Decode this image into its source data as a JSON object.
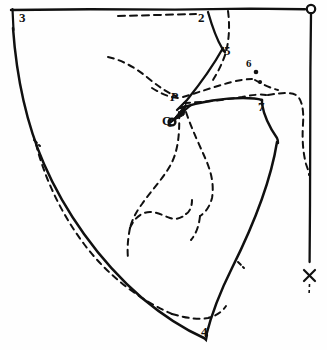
{
  "figure": {
    "background_color": "#fefefe",
    "ink_color": "#101010",
    "canvas": {
      "width": 327,
      "height": 350
    }
  },
  "labels": {
    "corner_top_left": "3",
    "top_center_right": "2",
    "upper_right_mid": "5",
    "right_upper": "6",
    "right_notch": "7",
    "bottom": "4",
    "point_p": "P",
    "point_q": "Q",
    "origin_o": "O",
    "mark_x": "X"
  },
  "geometry": {
    "top_edge": {
      "from_x": 12,
      "from_y": 10,
      "to_x": 311,
      "to_y": 9,
      "style": "solid"
    },
    "right_edge": {
      "from_x": 311,
      "from_y": 12,
      "to_x": 310,
      "to_y": 279,
      "style": "solid"
    },
    "left_edge_curve": "solid curved cut line from top-left down to bottom point 4",
    "right_edge_curve": "solid line from neckline notch down to bottom point 4",
    "inner_seam": "dashed line parallel to left curve and along bottom hem",
    "construction_lines": "dashed radial and contour lines through centre near P and Q",
    "arrow": {
      "from": "Q",
      "direction": "up-right",
      "style": "solid with filled head"
    }
  },
  "line_styles": {
    "solid_width": 2.2,
    "dash_pattern": "6 5",
    "dash_width": 2.0
  }
}
